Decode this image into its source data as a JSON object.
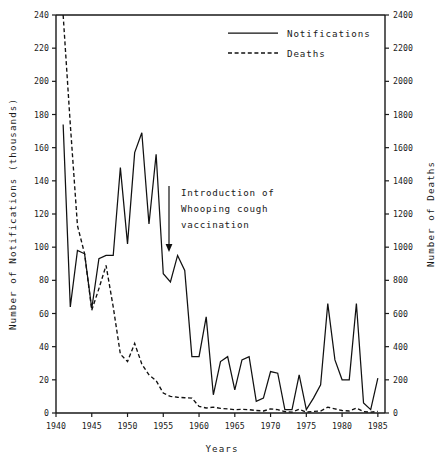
{
  "figure": {
    "background": "#ffffff",
    "ink": "#111111"
  },
  "axes": {
    "x_title": "Years",
    "y_left_title": "Number of Notifications (thousands)",
    "y_right_title": "Number of Deaths",
    "x_ticklabels": [
      "1940",
      "1945",
      "1950",
      "1955",
      "1960",
      "1965",
      "1970",
      "1975",
      "1980",
      "1985"
    ],
    "y_left_ticklabels": [
      "0",
      "20",
      "40",
      "60",
      "80",
      "100",
      "120",
      "140",
      "160",
      "180",
      "200",
      "220",
      "240"
    ],
    "y_right_ticklabels": [
      "0",
      "200",
      "400",
      "600",
      "800",
      "1000",
      "1200",
      "1400",
      "1600",
      "1800",
      "2000",
      "2200",
      "2400"
    ]
  },
  "legend": {
    "entries": [
      {
        "label": "Notifications",
        "style": "solid"
      },
      {
        "label": "Deaths",
        "style": "dashed"
      }
    ]
  },
  "annotation": {
    "lines": [
      "Introduction of",
      "Whooping cough",
      "vaccination"
    ],
    "arrow_target_year": 1958,
    "arrow_icon": "down-arrow-icon"
  },
  "chart_data": {
    "type": "line",
    "title": "",
    "xlabel": "Years",
    "ylabel": "Number of Notifications (thousands)",
    "y2label": "Number of Deaths",
    "xlim": [
      1940,
      1986
    ],
    "ylim": [
      0,
      240
    ],
    "y2lim": [
      0,
      2400
    ],
    "grid": false,
    "legend_position": "top-center",
    "xticks": [
      1940,
      1945,
      1950,
      1955,
      1960,
      1965,
      1970,
      1975,
      1980,
      1985
    ],
    "yticks": [
      0,
      20,
      40,
      60,
      80,
      100,
      120,
      140,
      160,
      180,
      200,
      220,
      240
    ],
    "y2ticks": [
      0,
      200,
      400,
      600,
      800,
      1000,
      1200,
      1400,
      1600,
      1800,
      2000,
      2200,
      2400
    ],
    "annotations": [
      {
        "text": "Introduction of Whooping cough vaccination",
        "x": 1958,
        "y": 120,
        "arrow_to_y": 78
      }
    ],
    "series": [
      {
        "name": "Notifications",
        "style": "solid",
        "axis": "left",
        "units": "thousands",
        "x": [
          1941,
          1942,
          1943,
          1944,
          1945,
          1946,
          1947,
          1948,
          1949,
          1950,
          1951,
          1952,
          1953,
          1954,
          1955,
          1956,
          1957,
          1958,
          1959,
          1960,
          1961,
          1962,
          1963,
          1964,
          1965,
          1966,
          1967,
          1968,
          1969,
          1970,
          1971,
          1972,
          1973,
          1974,
          1975,
          1976,
          1977,
          1978,
          1979,
          1980,
          1981,
          1982,
          1983,
          1984,
          1985,
          1986
        ],
        "values": [
          174,
          64,
          98,
          96,
          63,
          93,
          95,
          95,
          148,
          102,
          157,
          169,
          114,
          156,
          84,
          79,
          95,
          86,
          34,
          34,
          58,
          11,
          31,
          34,
          14,
          32,
          34,
          7,
          9,
          25,
          24,
          2,
          2,
          23,
          2,
          9,
          17,
          66,
          32,
          20,
          20,
          66,
          6,
          2,
          21,
          null
        ]
      },
      {
        "name": "Deaths",
        "style": "dashed",
        "axis": "right",
        "units": "deaths",
        "x": [
          1941,
          1942,
          1943,
          1944,
          1945,
          1946,
          1947,
          1948,
          1949,
          1950,
          1951,
          1952,
          1953,
          1954,
          1955,
          1956,
          1957,
          1958,
          1959,
          1960,
          1961,
          1962,
          1963,
          1964,
          1965,
          1966,
          1967,
          1968,
          1969,
          1970,
          1971,
          1972,
          1973,
          1974,
          1975,
          1976,
          1977,
          1978,
          1979,
          1980,
          1981,
          1982,
          1983,
          1984,
          1985,
          1986
        ],
        "values": [
          2400,
          1740,
          1130,
          960,
          620,
          750,
          890,
          640,
          355,
          310,
          420,
          295,
          230,
          195,
          120,
          100,
          95,
          92,
          90,
          40,
          30,
          35,
          28,
          25,
          20,
          22,
          20,
          15,
          12,
          25,
          20,
          8,
          5,
          22,
          5,
          10,
          12,
          35,
          25,
          15,
          12,
          30,
          8,
          5,
          10,
          null
        ]
      }
    ]
  }
}
